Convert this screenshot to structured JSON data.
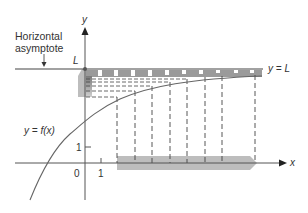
{
  "diagram": {
    "labels": {
      "y_axis": "y",
      "x_axis": "x",
      "asymptote_caption_line1": "Horizontal",
      "asymptote_caption_line2": "asymptote",
      "L_on_axis": "L",
      "asymptote_equation": "y = L",
      "function_label": "y = f(x)",
      "origin": "0",
      "x_tick_1": "1",
      "y_tick_1": "1"
    },
    "colors": {
      "axis": "#555555",
      "curve": "#666666",
      "band": "#bdbdbd",
      "dash": "#444444",
      "text": "#333333"
    }
  }
}
